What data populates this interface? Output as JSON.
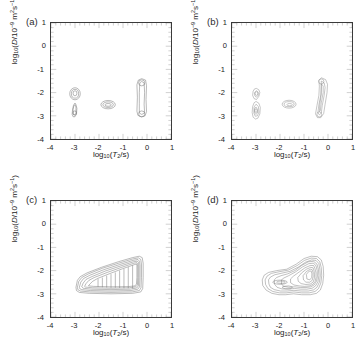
{
  "figure": {
    "title": "",
    "background_color": "#ffffff",
    "line_color": "#555555",
    "axis_color": "#3a3a3a",
    "panel_count": 4
  },
  "axes": {
    "x": {
      "label_plain": "log10(T2/s)",
      "label_parts": {
        "log": "log",
        "base": "10",
        "open": "(",
        "var": "T",
        "varsub": "2",
        "unit": "/s",
        "close": ")"
      },
      "min": -4,
      "max": 1,
      "ticks": [
        -4,
        -3,
        -2,
        -1,
        0,
        1
      ],
      "tick_labels": [
        "-4",
        "-3",
        "-2",
        "-1",
        "0",
        "1"
      ],
      "minor_per_interval": 5,
      "tick_direction": "in"
    },
    "y": {
      "label_plain": "log10(D/10-9 m2s-1)",
      "label_parts": {
        "log": "log",
        "base": "10",
        "open": "(",
        "var": "D",
        "slash": "/10",
        "exp": "−9",
        "units": " m",
        "usup": "2",
        "us": "s",
        "usup2": "−1",
        "close": ")"
      },
      "min": -4,
      "max": 1,
      "ticks": [
        1,
        0,
        -1,
        -2,
        -3,
        -4
      ],
      "tick_labels": [
        "1",
        "0",
        "-1",
        "-2",
        "-3",
        "-4"
      ],
      "minor_per_interval": 5,
      "tick_direction": "in"
    }
  },
  "panels": [
    {
      "id": "a",
      "label": "(a)",
      "pos": {
        "left": 0,
        "top": 0
      }
    },
    {
      "id": "b",
      "label": "(b)",
      "pos": {
        "left": 181,
        "top": 0
      }
    },
    {
      "id": "c",
      "label": "(c)",
      "pos": {
        "left": 0,
        "top": 178
      }
    },
    {
      "id": "d",
      "label": "(d)",
      "pos": {
        "left": 181,
        "top": 178
      }
    }
  ],
  "chart_data": [
    {
      "type": "contour",
      "panel": "a",
      "title": "(a)",
      "xlabel": "log10(T2/s)",
      "ylabel": "log10(D/10-9 m2s-1)",
      "xlim": [
        -4,
        1
      ],
      "ylim": [
        -4,
        1
      ],
      "grid": false,
      "legend": "none",
      "description": "Four separated contour peaks: two stacked lobes near log10(T2)=-3, one small oval near log10(T2)=-1.6, and a tall narrow vertical feature near log10(T2)=0.",
      "peaks": [
        {
          "name": "peak-1",
          "x": -3.0,
          "y": -1.05,
          "shape": "oval",
          "rx": 0.22,
          "ry": 0.26,
          "levels": 3
        },
        {
          "name": "peak-2",
          "x": -3.0,
          "y": -2.05,
          "shape": "teardrop",
          "rx": 0.22,
          "ry": 0.4,
          "levels": 3
        },
        {
          "name": "peak-3",
          "x": -1.62,
          "y": -1.58,
          "shape": "oval",
          "rx": 0.3,
          "ry": 0.18,
          "levels": 3
        },
        {
          "name": "peak-4",
          "x": -0.1,
          "y": -1.5,
          "shape": "vertical-bar",
          "rx": 0.28,
          "ry": 1.15,
          "levels": 3
        }
      ]
    },
    {
      "type": "contour",
      "panel": "b",
      "title": "(b)",
      "xlabel": "log10(T2/s)",
      "ylabel": "log10(D/10-9 m2s-1)",
      "xlim": [
        -4,
        1
      ],
      "ylim": [
        -4,
        1
      ],
      "grid": false,
      "legend": "none",
      "description": "Similar four-peak structure to (a) but with rougher, more ragged contours; the near-zero T2 feature is a curved crescent.",
      "peaks": [
        {
          "name": "peak-1",
          "x": -2.98,
          "y": -1.05,
          "shape": "blob",
          "rx": 0.2,
          "ry": 0.28,
          "levels": 3
        },
        {
          "name": "peak-2",
          "x": -2.98,
          "y": -2.05,
          "shape": "blob",
          "rx": 0.22,
          "ry": 0.45,
          "levels": 4
        },
        {
          "name": "peak-3",
          "x": -1.62,
          "y": -1.52,
          "shape": "oval",
          "rx": 0.28,
          "ry": 0.16,
          "levels": 3
        },
        {
          "name": "peak-4",
          "x": -0.15,
          "y": -1.45,
          "shape": "crescent",
          "rx": 0.3,
          "ry": 1.15,
          "levels": 4
        }
      ]
    },
    {
      "type": "contour",
      "panel": "c",
      "title": "(c)",
      "xlabel": "log10(T2/s)",
      "ylabel": "log10(D/10-9 m2s-1)",
      "xlim": [
        -4,
        1
      ],
      "ylim": [
        -4,
        1
      ],
      "grid": false,
      "legend": "none",
      "description": "A single large continuous wedge/triangular ridge extending from about log10(T2)=-2.9 up to -0.2, spanning log10(D) from -2.6 to -0.35, with many nested contour levels.",
      "peaks": [
        {
          "name": "ridge",
          "x_range": [
            -2.95,
            -0.2
          ],
          "y_range": [
            -2.65,
            -0.35
          ],
          "levels": 7
        }
      ]
    },
    {
      "type": "contour",
      "panel": "d",
      "title": "(d)",
      "xlabel": "log10(T2/s)",
      "ylabel": "log10(D/10-9 m2s-1)",
      "xlim": [
        -4,
        1
      ],
      "ylim": [
        -4,
        1
      ],
      "grid": false,
      "legend": "none",
      "description": "A single broad irregular cluster centred near log10(T2)=-1.0, log10(D)=-1.3, with a dense set of nested contours and a tail extending to low T2.",
      "peaks": [
        {
          "name": "cluster",
          "x_range": [
            -2.75,
            -0.15
          ],
          "y_range": [
            -2.7,
            -0.35
          ],
          "center_x": -0.85,
          "center_y": -1.15,
          "levels": 8
        }
      ]
    }
  ]
}
